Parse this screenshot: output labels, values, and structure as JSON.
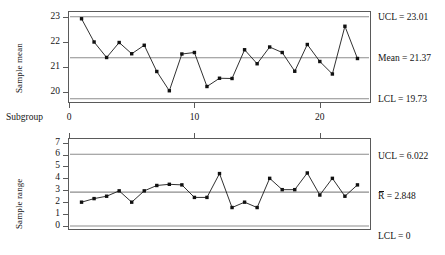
{
  "chart_data": [
    {
      "type": "line",
      "name": "xbar-chart",
      "title": "",
      "xlabel": "Subgroup",
      "ylabel": "Sample mean",
      "x": [
        1,
        2,
        3,
        4,
        5,
        6,
        7,
        8,
        9,
        10,
        11,
        12,
        13,
        14,
        15,
        16,
        17,
        18,
        19,
        20,
        21,
        22,
        23
      ],
      "values": [
        22.93,
        22.0,
        21.38,
        21.98,
        21.53,
        21.87,
        20.82,
        20.05,
        21.52,
        21.58,
        20.22,
        20.55,
        20.54,
        21.69,
        21.13,
        21.8,
        21.58,
        20.83,
        21.9,
        21.22,
        20.72,
        22.63,
        21.34
      ],
      "ylim": [
        19.6,
        23.2
      ],
      "yticks": [
        20,
        21,
        22,
        23
      ],
      "xlim": [
        0,
        24
      ],
      "xticks": [
        0,
        10,
        20
      ],
      "grid": false,
      "legend": "right-outside",
      "reference_lines": [
        {
          "key": "ucl",
          "label": "UCL = 23.01",
          "value": 23.01
        },
        {
          "key": "center",
          "label": "Mean = 21.37",
          "value": 21.37
        },
        {
          "key": "lcl",
          "label": "LCL = 19.73",
          "value": 19.73
        }
      ]
    },
    {
      "type": "line",
      "name": "range-chart",
      "title": "",
      "xlabel": "",
      "ylabel": "Sample range",
      "x": [
        1,
        2,
        3,
        4,
        5,
        6,
        7,
        8,
        9,
        10,
        11,
        12,
        13,
        14,
        15,
        16,
        17,
        18,
        19,
        20,
        21,
        22,
        23
      ],
      "values": [
        2.0,
        2.3,
        2.5,
        2.95,
        2.0,
        2.95,
        3.4,
        3.5,
        3.45,
        2.4,
        2.4,
        4.4,
        1.55,
        2.0,
        1.55,
        4.0,
        3.05,
        3.05,
        4.45,
        2.6,
        4.0,
        2.5,
        3.45
      ],
      "ylim": [
        -0.25,
        7.3
      ],
      "yticks": [
        0,
        1,
        2,
        3,
        4,
        5,
        6,
        7
      ],
      "xlim": [
        0,
        24
      ],
      "xticks": [
        0,
        10,
        20
      ],
      "grid": false,
      "legend": "right-outside",
      "reference_lines": [
        {
          "key": "ucl",
          "label": "UCL = 6.022",
          "value": 6.022
        },
        {
          "key": "center",
          "label": "R̅ = 2.848",
          "value": 2.848,
          "symbol": "R",
          "symbol_overbar": true,
          "text_after": " = 2.848"
        },
        {
          "key": "lcl",
          "label": "LCL = 0",
          "value": 0
        }
      ]
    }
  ],
  "colors": {
    "series_line": "#1a1a1a",
    "marker": "#111111",
    "reference_line": "#8c8c8c",
    "frame": "#5a5a5a",
    "text": "#141414",
    "background": "#ffffff"
  },
  "xbar": {
    "y_axis_title": "Sample mean",
    "x_axis_title": "Subgroup",
    "ytick_labels": [
      "23",
      "22",
      "21",
      "20"
    ],
    "xtick_labels": [
      "0",
      "10",
      "20"
    ],
    "ucl_label": "UCL = 23.01",
    "center_label": "Mean = 21.37",
    "lcl_label": "LCL = 19.73"
  },
  "range": {
    "y_axis_title": "Sample range",
    "ytick_labels": [
      "7",
      "6",
      "5",
      "4",
      "3",
      "2",
      "1",
      "0"
    ],
    "ucl_label": "UCL = 6.022",
    "center_symbol": "R",
    "center_label_rest": " = 2.848",
    "center_label": "R̅ = 2.848",
    "lcl_label": "LCL = 0"
  }
}
